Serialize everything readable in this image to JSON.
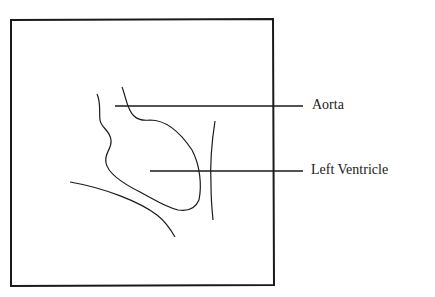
{
  "diagram": {
    "type": "anatomical-line-drawing",
    "labels": [
      {
        "id": "aorta",
        "text": "Aorta"
      },
      {
        "id": "left-ventricle",
        "text": "Left Ventricle"
      }
    ],
    "colors": {
      "stroke": "#1a1a1a",
      "background": "#ffffff"
    }
  }
}
